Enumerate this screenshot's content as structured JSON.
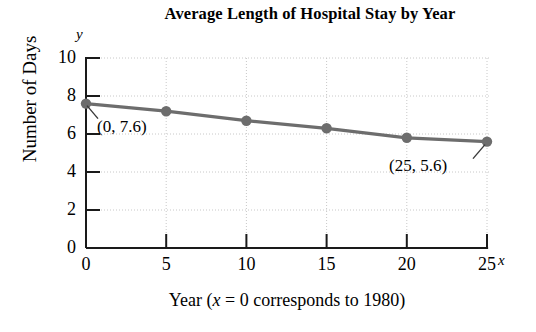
{
  "chart_data": {
    "type": "line",
    "title": "Average Length of Hospital Stay by Year",
    "xlabel": "Year (x = 0 corresponds to 1980)",
    "ylabel": "Number of Days",
    "x": [
      0,
      5,
      10,
      15,
      20,
      25
    ],
    "values": [
      7.6,
      7.2,
      6.7,
      6.3,
      5.8,
      5.6
    ],
    "series": [
      {
        "name": "Average Length of Hospital Stay",
        "values": [
          7.6,
          7.2,
          6.7,
          6.3,
          5.8,
          5.6
        ]
      }
    ],
    "xlim": [
      0,
      25
    ],
    "ylim": [
      0,
      10
    ],
    "xticks": [
      "0",
      "5",
      "10",
      "15",
      "20",
      "25"
    ],
    "yticks": [
      "0",
      "2",
      "4",
      "6",
      "8",
      "10"
    ],
    "grid": true,
    "legend": "none",
    "axis_letters": {
      "x": "x",
      "y": "y"
    },
    "annotations": [
      {
        "label": "(0, 7.6)",
        "x": 0,
        "y": 7.6
      },
      {
        "label": "(25, 5.6)",
        "x": 25,
        "y": 5.6
      }
    ],
    "colors": {
      "series": "#6d6d6d",
      "marker": "#6d6d6d",
      "axis": "#1a1a1a",
      "grid": "#c8c8c8",
      "text": "#000000",
      "background": "#ffffff"
    }
  },
  "xlabel_parts": {
    "before": "Year (",
    "italic_x": "x",
    "after": " = 0 corresponds to 1980)"
  }
}
